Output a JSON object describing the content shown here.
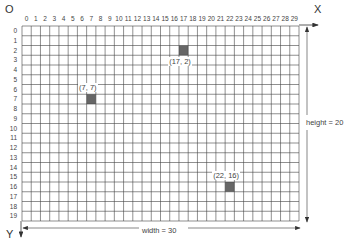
{
  "origin_label": "O",
  "x_axis_label": "X",
  "y_axis_label": "Y",
  "width_label": "width = 30",
  "height_label": "height = 20",
  "grid": {
    "columns": 30,
    "rows": 20,
    "line_color": "#444444",
    "cell_fill_color": "#666666"
  },
  "column_ticks": [
    "0",
    "1",
    "2",
    "3",
    "4",
    "5",
    "6",
    "7",
    "8",
    "9",
    "10",
    "11",
    "12",
    "13",
    "14",
    "15",
    "16",
    "17",
    "18",
    "19",
    "20",
    "21",
    "22",
    "23",
    "24",
    "25",
    "26",
    "27",
    "28",
    "29"
  ],
  "row_ticks": [
    "0",
    "1",
    "2",
    "3",
    "4",
    "5",
    "6",
    "7",
    "8",
    "9",
    "10",
    "11",
    "12",
    "13",
    "14",
    "15",
    "16",
    "17",
    "18",
    "19"
  ],
  "points": [
    {
      "x": 17,
      "y": 2,
      "label": "(17, 2)"
    },
    {
      "x": 7,
      "y": 7,
      "label": "(7, 7)"
    },
    {
      "x": 22,
      "y": 16,
      "label": "(22, 16)"
    }
  ]
}
